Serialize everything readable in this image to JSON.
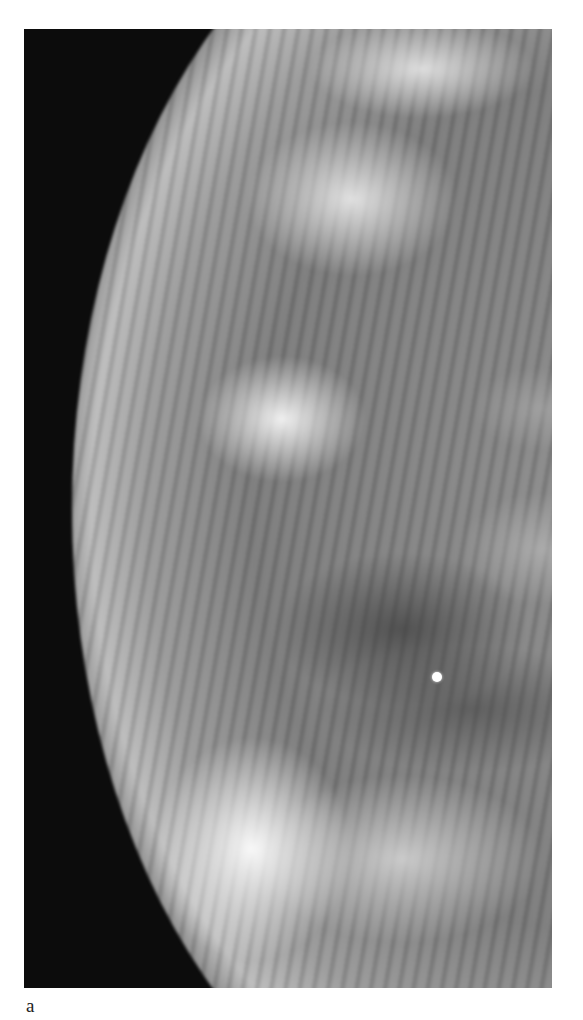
{
  "figure": {
    "type": "mammogram",
    "panel_label": "a"
  },
  "colors": {
    "background": "#ffffff",
    "image_background": "#0c0c0c",
    "label_text": "#222222"
  }
}
